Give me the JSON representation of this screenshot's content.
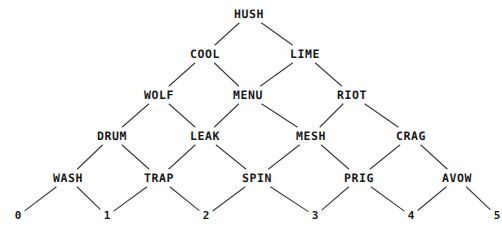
{
  "diagram": {
    "type": "binomial-lattice",
    "title": "",
    "width": 502,
    "height": 237,
    "background_color": "#fefefe",
    "edge_color": "#3a3a3a",
    "text_color": "#1a1a1a",
    "levels": 5,
    "nodes": [
      {
        "id": "n0_0",
        "label": "HUSH",
        "level": 0,
        "index": 0,
        "x": 249,
        "y": 14
      },
      {
        "id": "n1_0",
        "label": "COOL",
        "level": 1,
        "index": 0,
        "x": 205,
        "y": 54
      },
      {
        "id": "n1_1",
        "label": "LIME",
        "level": 1,
        "index": 1,
        "x": 305,
        "y": 54
      },
      {
        "id": "n2_0",
        "label": "WOLF",
        "level": 2,
        "index": 0,
        "x": 159,
        "y": 95
      },
      {
        "id": "n2_1",
        "label": "MENU",
        "level": 2,
        "index": 1,
        "x": 248,
        "y": 95
      },
      {
        "id": "n2_2",
        "label": "RIOT",
        "level": 2,
        "index": 2,
        "x": 352,
        "y": 95
      },
      {
        "id": "n3_0",
        "label": "DRUM",
        "level": 3,
        "index": 0,
        "x": 112,
        "y": 136
      },
      {
        "id": "n3_1",
        "label": "LEAK",
        "level": 3,
        "index": 1,
        "x": 205,
        "y": 136
      },
      {
        "id": "n3_2",
        "label": "MESH",
        "level": 3,
        "index": 2,
        "x": 311,
        "y": 136
      },
      {
        "id": "n3_3",
        "label": "CRAG",
        "level": 3,
        "index": 3,
        "x": 411,
        "y": 136
      },
      {
        "id": "n4_0",
        "label": "WASH",
        "level": 4,
        "index": 0,
        "x": 68,
        "y": 178
      },
      {
        "id": "n4_1",
        "label": "TRAP",
        "level": 4,
        "index": 1,
        "x": 159,
        "y": 178
      },
      {
        "id": "n4_2",
        "label": "SPIN",
        "level": 4,
        "index": 2,
        "x": 257,
        "y": 178
      },
      {
        "id": "n4_3",
        "label": "PRIG",
        "level": 4,
        "index": 3,
        "x": 359,
        "y": 178
      },
      {
        "id": "n4_4",
        "label": "AVOW",
        "level": 4,
        "index": 4,
        "x": 457,
        "y": 178
      }
    ],
    "edges": [
      {
        "from": "n0_0",
        "to": "n1_0"
      },
      {
        "from": "n0_0",
        "to": "n1_1"
      },
      {
        "from": "n1_0",
        "to": "n2_0"
      },
      {
        "from": "n1_0",
        "to": "n2_1"
      },
      {
        "from": "n1_1",
        "to": "n2_1"
      },
      {
        "from": "n1_1",
        "to": "n2_2"
      },
      {
        "from": "n2_0",
        "to": "n3_0"
      },
      {
        "from": "n2_0",
        "to": "n3_1"
      },
      {
        "from": "n2_1",
        "to": "n3_1"
      },
      {
        "from": "n2_1",
        "to": "n3_2"
      },
      {
        "from": "n2_2",
        "to": "n3_2"
      },
      {
        "from": "n2_2",
        "to": "n3_3"
      },
      {
        "from": "n3_0",
        "to": "n4_0"
      },
      {
        "from": "n3_0",
        "to": "n4_1"
      },
      {
        "from": "n3_1",
        "to": "n4_1"
      },
      {
        "from": "n3_1",
        "to": "n4_2"
      },
      {
        "from": "n3_2",
        "to": "n4_2"
      },
      {
        "from": "n3_2",
        "to": "n4_3"
      },
      {
        "from": "n3_3",
        "to": "n4_3"
      },
      {
        "from": "n3_3",
        "to": "n4_4"
      },
      {
        "from": "n4_0",
        "to": "a0"
      },
      {
        "from": "n4_0",
        "to": "a1"
      },
      {
        "from": "n4_1",
        "to": "a1"
      },
      {
        "from": "n4_1",
        "to": "a2"
      },
      {
        "from": "n4_2",
        "to": "a2"
      },
      {
        "from": "n4_2",
        "to": "a3"
      },
      {
        "from": "n4_3",
        "to": "a3"
      },
      {
        "from": "n4_3",
        "to": "a4"
      },
      {
        "from": "n4_4",
        "to": "a4"
      },
      {
        "from": "n4_4",
        "to": "a5"
      }
    ],
    "axis_labels": [
      {
        "id": "a0",
        "label": "0",
        "x": 18,
        "y": 216
      },
      {
        "id": "a1",
        "label": "1",
        "x": 107,
        "y": 216
      },
      {
        "id": "a2",
        "label": "2",
        "x": 206,
        "y": 216
      },
      {
        "id": "a3",
        "label": "3",
        "x": 315,
        "y": 216
      },
      {
        "id": "a4",
        "label": "4",
        "x": 411,
        "y": 216
      },
      {
        "id": "a5",
        "label": "5",
        "x": 497,
        "y": 216
      }
    ]
  }
}
